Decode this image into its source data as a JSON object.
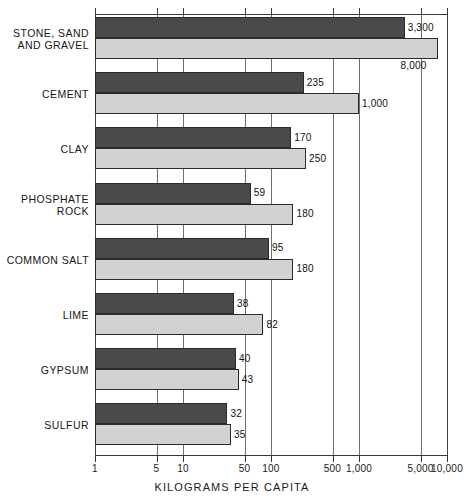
{
  "chart_data": {
    "type": "bar",
    "orientation": "horizontal",
    "title": "",
    "xlabel": "KILOGRAMS PER CAPITA",
    "ylabel": "",
    "xscale": "log",
    "xlim": [
      1,
      10000
    ],
    "grid": true,
    "legend_position": "none",
    "xticks": [
      1,
      5,
      10,
      50,
      100,
      500,
      1000,
      5000,
      10000
    ],
    "xtick_labels": [
      "1",
      "5",
      "10",
      "50",
      "100",
      "500",
      "1,000",
      "5,000",
      "10,000"
    ],
    "categories": [
      "STONE, SAND\nAND GRAVEL",
      "CEMENT",
      "CLAY",
      "PHOSPHATE\nROCK",
      "COMMON SALT",
      "LIME",
      "GYPSUM",
      "SULFUR"
    ],
    "series": [
      {
        "name": "dark",
        "color": "#4a4a4a",
        "values": [
          3300,
          235,
          170,
          59,
          95,
          38,
          40,
          32
        ],
        "value_labels": [
          "3,300",
          "235",
          "170",
          "59",
          "95",
          "38",
          "40",
          "32"
        ]
      },
      {
        "name": "light",
        "color": "#d2d2d2",
        "values": [
          8000,
          1000,
          250,
          180,
          180,
          82,
          43,
          35
        ],
        "value_labels": [
          "8,000",
          "1,000",
          "250",
          "180",
          "180",
          "82",
          "43",
          "35"
        ]
      }
    ]
  }
}
